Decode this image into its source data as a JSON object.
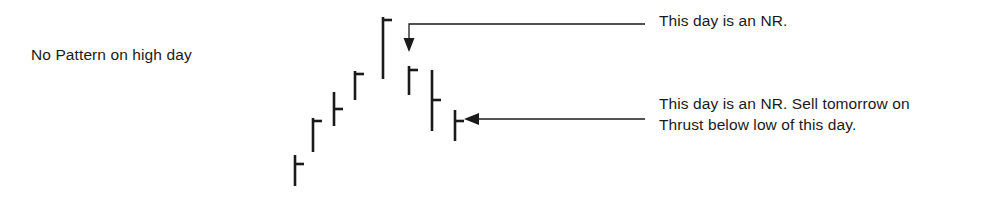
{
  "figure": {
    "title_left": "No Pattern on high day",
    "background_color": "#ffffff",
    "ink_color": "#1a1a1a",
    "width": 1004,
    "height": 208
  },
  "annotations": [
    {
      "id": "nr-high",
      "text": "This day is an NR.",
      "points_to_bar": 6,
      "leader": {
        "x_text_end": 645,
        "y": 24,
        "elbow_x": 409,
        "arrow_y": 50,
        "direction": "down"
      }
    },
    {
      "id": "nr-sell",
      "line1": "This day is an NR. Sell tomorrow on",
      "line2": "Thrust below low of this day.",
      "points_to_bar": 8,
      "leader": {
        "x_text_end": 645,
        "y": 119,
        "arrow_x": 464,
        "direction": "left"
      }
    }
  ],
  "chart_data": {
    "type": "bar",
    "title": "No Pattern on high day",
    "xlabel": "",
    "ylabel": "",
    "grid": false,
    "legend": "none",
    "categories": [
      "1",
      "2",
      "3",
      "4",
      "5",
      "6",
      "7",
      "8"
    ],
    "series": [
      {
        "name": "daily-range-bars",
        "bars": [
          {
            "index": 1,
            "x": 295,
            "high_y": 155,
            "low_y": 186,
            "close_tick_y": 164,
            "tick_side": "right"
          },
          {
            "index": 2,
            "x": 313,
            "high_y": 118,
            "low_y": 152,
            "close_tick_y": 121,
            "tick_side": "right"
          },
          {
            "index": 3,
            "x": 334,
            "high_y": 92,
            "low_y": 126,
            "close_tick_y": 109,
            "tick_side": "right"
          },
          {
            "index": 4,
            "x": 355,
            "high_y": 71,
            "low_y": 100,
            "close_tick_y": 74,
            "tick_side": "right"
          },
          {
            "index": 5,
            "x": 383,
            "high_y": 17,
            "low_y": 79,
            "close_tick_y": 20,
            "tick_side": "right"
          },
          {
            "index": 6,
            "x": 409,
            "high_y": 66,
            "low_y": 95,
            "close_tick_y": 70,
            "tick_side": "right"
          },
          {
            "index": 7,
            "x": 432,
            "high_y": 70,
            "low_y": 131,
            "close_tick_y": 100,
            "tick_side": "right"
          },
          {
            "index": 8,
            "x": 455,
            "high_y": 110,
            "low_y": 141,
            "close_tick_y": 121,
            "tick_side": "right"
          }
        ]
      }
    ]
  }
}
